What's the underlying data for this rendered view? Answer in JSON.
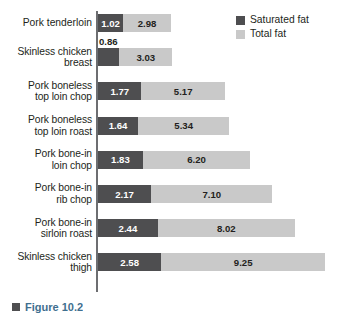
{
  "chart_data": {
    "type": "bar",
    "orientation": "horizontal",
    "stacked": true,
    "title": "",
    "xlabel": "",
    "ylabel": "",
    "grid": false,
    "xlim": [
      0,
      9.8
    ],
    "legend_position": "top-right",
    "categories": [
      "Pork tenderloin",
      "Skinless chicken breast",
      "Pork boneless top loin chop",
      "Pork boneless top loin roast",
      "Pork bone-in loin chop",
      "Pork bone-in rib chop",
      "Pork bone-in sirloin roast",
      "Skinless chicken thigh"
    ],
    "series": [
      {
        "name": "Saturated fat",
        "color": "#4e4e50",
        "values": [
          1.02,
          0.86,
          1.77,
          1.64,
          1.83,
          2.17,
          2.44,
          2.58
        ]
      },
      {
        "name": "Total fat",
        "color": "#c9c9c9",
        "values": [
          2.98,
          3.03,
          5.17,
          5.34,
          6.2,
          7.1,
          8.02,
          9.25
        ]
      }
    ]
  },
  "legend": {
    "items": [
      {
        "label": "Saturated fat",
        "color": "#4e4e50"
      },
      {
        "label": "Total fat",
        "color": "#c9c9c9"
      }
    ]
  },
  "rows": [
    {
      "label": "Pork tenderloin",
      "sat": "1.02",
      "tot": "2.98",
      "sat_inside": true
    },
    {
      "label": "Skinless chicken\nbreast",
      "sat": "0.86",
      "tot": "3.03",
      "sat_inside": false
    },
    {
      "label": "Pork boneless\ntop loin chop",
      "sat": "1.77",
      "tot": "5.17",
      "sat_inside": true
    },
    {
      "label": "Pork boneless\ntop loin roast",
      "sat": "1.64",
      "tot": "5.34",
      "sat_inside": true
    },
    {
      "label": "Pork bone-in\nloin chop",
      "sat": "1.83",
      "tot": "6.20",
      "sat_inside": true
    },
    {
      "label": "Pork bone-in\nrib chop",
      "sat": "2.17",
      "tot": "7.10",
      "sat_inside": true
    },
    {
      "label": "Pork bone-in\nsirloin roast",
      "sat": "2.44",
      "tot": "8.02",
      "sat_inside": true
    },
    {
      "label": "Skinless chicken\nthigh",
      "sat": "2.58",
      "tot": "9.25",
      "sat_inside": true
    }
  ],
  "footer": {
    "caption": "Figure 10.2"
  },
  "colors": {
    "saturated_fat": "#4e4e50",
    "total_fat": "#c9c9c9",
    "axis": "#6d6e71",
    "text": "#231f20"
  }
}
